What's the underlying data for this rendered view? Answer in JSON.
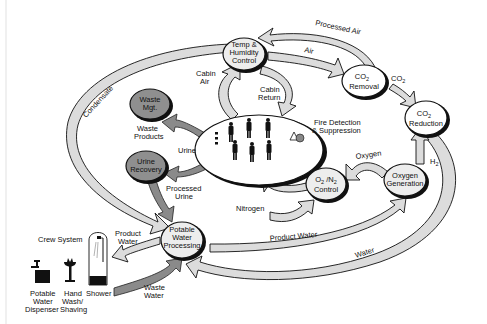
{
  "nodes": {
    "temp_humidity": {
      "line1": "Temp &",
      "line2": "Humidity",
      "line3": "Control"
    },
    "co2_removal": {
      "line1": "CO",
      "sub": "2",
      "line2": "Removal"
    },
    "co2_reduction": {
      "line1": "CO",
      "sub": "2",
      "line2": "Reduction"
    },
    "waste_mgt": {
      "line1": "Waste",
      "line2": "Mgt."
    },
    "urine_recovery": {
      "line1": "Urine",
      "line2": "Recovery"
    },
    "potable_water": {
      "line1": "Potable",
      "line2": "Water",
      "line3": "Processing"
    },
    "o2n2_control": {
      "line1": "O",
      "sub1": "2",
      "mid": " /N",
      "sub2": "2",
      "line2": "Control"
    },
    "oxygen_generation": {
      "line1": "Oxygen",
      "line2": "Generation"
    },
    "crew_cabin": {
      "label": "Crew cabin"
    }
  },
  "flows": {
    "condensate": "Condensate",
    "processed_air": "Processed Air",
    "air": "Air",
    "co2": "CO",
    "co2_sub": "2",
    "cabin_air_1": "Cabin",
    "cabin_air_2": "Air",
    "cabin_return_1": "Cabin",
    "cabin_return_2": "Return",
    "fire_1": "Fire Detection",
    "fire_2": "& Suppression",
    "waste_products_1": "Waste",
    "waste_products_2": "Products",
    "urine": "Urine",
    "processed_urine_1": "Processed",
    "processed_urine_2": "Urine",
    "oxygen": "Oxygen",
    "h2": "H",
    "h2_sub": "2",
    "nitrogen": "Nitrogen",
    "product_water_left_1": "Product",
    "product_water_left_2": "Water",
    "product_water": "Product Water",
    "water": "Water",
    "waste_water_1": "Waste",
    "waste_water_2": "Water"
  },
  "crew_system": {
    "title": "Crew System",
    "items": [
      {
        "line1": "Potable",
        "line2": "Water",
        "line3": "Dispenser"
      },
      {
        "line1": "Hand",
        "line2": "Wash/",
        "line3": "Shaving"
      },
      {
        "line1": "Shower"
      }
    ]
  }
}
